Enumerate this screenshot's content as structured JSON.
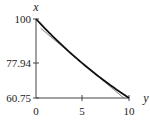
{
  "chart_data": {
    "type": "line",
    "title": "",
    "xlabel": "y",
    "ylabel": "x",
    "xlim": [
      0,
      10
    ],
    "ylim": [
      60.75,
      100
    ],
    "x_ticks": [
      0,
      5,
      10
    ],
    "x_tick_labels": [
      "0",
      "5",
      "10"
    ],
    "y_ticks": [
      100,
      77.94,
      60.75
    ],
    "y_tick_labels": [
      "100",
      "77.94",
      "60.75"
    ],
    "grid": false,
    "legend": null,
    "series": [
      {
        "name": "curve",
        "style": "thick",
        "color": "#111111",
        "x": [
          0,
          1,
          2,
          3,
          4,
          5,
          6,
          7,
          8,
          9,
          10
        ],
        "values": [
          100,
          95.14,
          90.52,
          86.12,
          81.94,
          77.94,
          74.16,
          70.56,
          67.13,
          63.87,
          60.75
        ]
      },
      {
        "name": "tangent-at-5",
        "style": "thin",
        "color": "#666666",
        "x": [
          0.5,
          9.5
        ],
        "values": [
          95.4,
          60.5
        ]
      }
    ]
  },
  "labels": {
    "x_axis": "y",
    "y_axis": "x",
    "yt0": "100",
    "yt1": "77.94",
    "yt2": "60.75",
    "xt0": "0",
    "xt1": "5",
    "xt2": "10"
  }
}
